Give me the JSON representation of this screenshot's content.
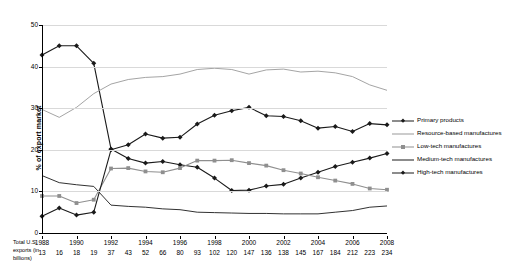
{
  "chart_data": {
    "type": "line",
    "title": "",
    "xlabel": "",
    "ylabel": "% of export market",
    "ylim": [
      0,
      50
    ],
    "yticks": [
      0,
      10,
      20,
      30,
      40,
      50
    ],
    "grid": true,
    "legend_position": "right",
    "x": [
      1988,
      1989,
      1990,
      1991,
      1992,
      1993,
      1994,
      1995,
      1996,
      1997,
      1998,
      1999,
      2000,
      2001,
      2002,
      2003,
      2004,
      2005,
      2006,
      2007,
      2008
    ],
    "xtick_labels": [
      "1988",
      "1990",
      "1992",
      "1994",
      "1996",
      "1998",
      "2000",
      "2002",
      "2004",
      "2006",
      "2008"
    ],
    "xtick_values": [
      1988,
      1990,
      1992,
      1994,
      1996,
      1998,
      2000,
      2002,
      2004,
      2006,
      2008
    ],
    "series": [
      {
        "name": "Primary products",
        "color": "#1a1a1a",
        "marker": "diamond",
        "values": [
          42.8,
          45.0,
          45.0,
          40.8,
          20.2,
          17.9,
          16.8,
          17.2,
          16.4,
          15.8,
          13.2,
          10.2,
          10.3,
          11.3,
          11.7,
          13.2,
          14.6,
          16.0,
          17.0,
          18.0,
          19.1
        ]
      },
      {
        "name": "Resource-based manufactures",
        "color": "#9a9a9a",
        "marker": "none",
        "values": [
          29.7,
          27.8,
          30.2,
          33.5,
          35.8,
          36.9,
          37.4,
          37.6,
          38.2,
          39.3,
          39.6,
          39.3,
          38.2,
          39.2,
          39.4,
          38.7,
          38.9,
          38.5,
          37.6,
          35.6,
          34.3
        ]
      },
      {
        "name": "Low-tech manufactures",
        "color": "#8f8f8f",
        "marker": "square",
        "values": [
          8.9,
          8.9,
          7.2,
          8.0,
          15.5,
          15.6,
          14.8,
          14.6,
          15.6,
          17.4,
          17.4,
          17.5,
          16.8,
          16.2,
          15.1,
          14.3,
          13.4,
          12.6,
          11.8,
          10.7,
          10.4
        ]
      },
      {
        "name": "Medium-tech manufactures",
        "color": "#1a1a1a",
        "marker": "none",
        "values": [
          13.8,
          12.1,
          11.6,
          11.2,
          6.7,
          6.4,
          6.2,
          5.8,
          5.6,
          5.0,
          4.9,
          4.8,
          4.7,
          4.7,
          4.6,
          4.6,
          4.6,
          5.0,
          5.4,
          6.2,
          6.5
        ]
      },
      {
        "name": "High-tech manufactures",
        "color": "#1a1a1a",
        "marker": "diamond",
        "values": [
          4.0,
          6.0,
          4.3,
          5.0,
          20.0,
          21.2,
          23.8,
          22.8,
          23.0,
          26.2,
          28.3,
          29.4,
          30.2,
          28.2,
          28.0,
          27.0,
          25.2,
          25.6,
          24.4,
          26.3,
          26.0
        ]
      }
    ],
    "secondary_axis": {
      "label": "Total U.S. exports (in billions)",
      "values": [
        13,
        16,
        18,
        19,
        37,
        43,
        52,
        66,
        80,
        93,
        102,
        120,
        147,
        136,
        138,
        145,
        167,
        184,
        212,
        223,
        234
      ]
    }
  }
}
